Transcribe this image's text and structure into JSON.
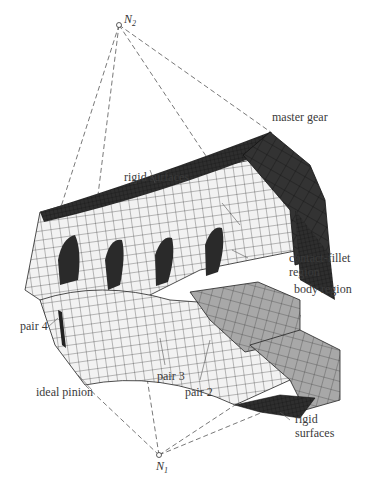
{
  "nodes": {
    "top": {
      "label": "N",
      "sub": "2"
    },
    "bottom": {
      "label": "N",
      "sub": "1"
    }
  },
  "labels": {
    "master_gear": "master gear",
    "rigid_surfaces_top": "rigid surfaces",
    "contact_fillet_1": "contact-fillet",
    "contact_fillet_2": "region",
    "body_region": "body region",
    "pair_4": "pair 4",
    "pair_3": "pair 3",
    "pair_2": "pair 2",
    "ideal_pinion": "ideal pinion",
    "rigid_surfaces_bottom_1": "rigid",
    "rigid_surfaces_bottom_2": "surfaces"
  },
  "colors": {
    "mesh_dark": "#2e2e2e",
    "mesh_light": "#f2f2f2",
    "mesh_mid": "#a8a8a8",
    "mesh_line": "#222222",
    "dash_line": "#555555"
  }
}
